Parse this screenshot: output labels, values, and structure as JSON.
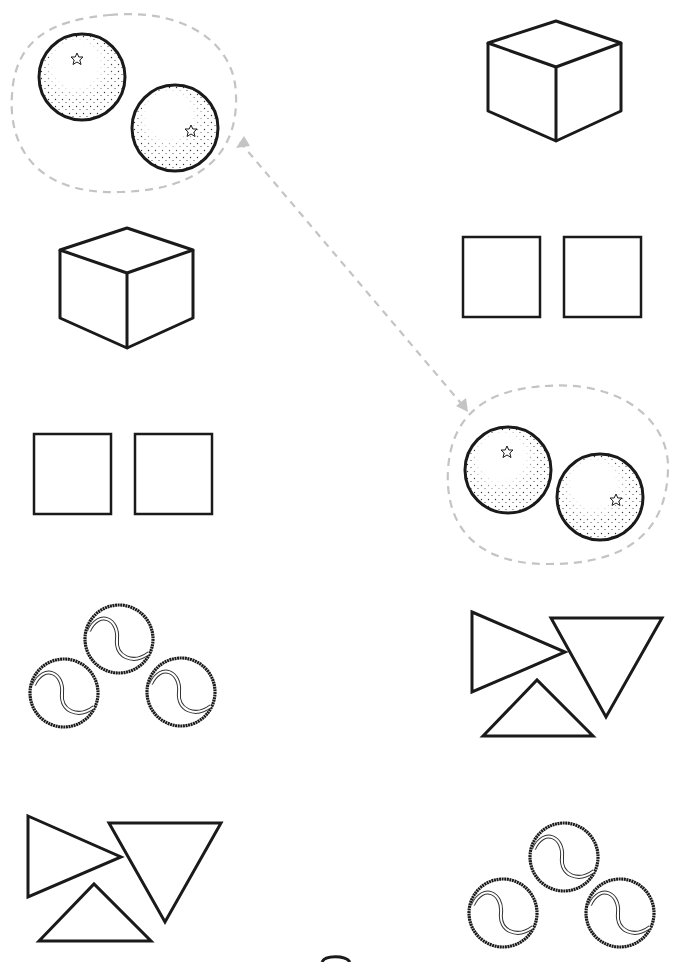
{
  "worksheet": {
    "task": "Match identical picture groups",
    "left_column": [
      {
        "id": "l1",
        "content": "two-oranges",
        "count": 2,
        "circled": true
      },
      {
        "id": "l2",
        "content": "cube",
        "count": 1
      },
      {
        "id": "l3",
        "content": "two-squares",
        "count": 2
      },
      {
        "id": "l4",
        "content": "three-tennis-balls",
        "count": 3
      },
      {
        "id": "l5",
        "content": "three-triangles",
        "count": 3
      }
    ],
    "right_column": [
      {
        "id": "r1",
        "content": "cube",
        "count": 1
      },
      {
        "id": "r2",
        "content": "two-squares",
        "count": 2
      },
      {
        "id": "r3",
        "content": "two-oranges",
        "count": 2,
        "circled": true
      },
      {
        "id": "r4",
        "content": "three-triangles",
        "count": 3
      },
      {
        "id": "r5",
        "content": "three-tennis-balls",
        "count": 3
      }
    ],
    "example_connection": {
      "from": "l1",
      "to": "r3",
      "style": "dashed-arrow"
    },
    "colors": {
      "outline": "#1a1a1a",
      "dashed": "#c4c4c4",
      "background": "#ffffff"
    }
  }
}
